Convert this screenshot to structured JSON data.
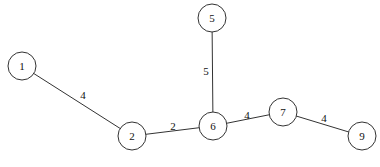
{
  "graph": {
    "type": "weighted-undirected-tree",
    "nodes": [
      {
        "id": "1",
        "label": "1",
        "x": 22,
        "y": 66
      },
      {
        "id": "2",
        "label": "2",
        "x": 132,
        "y": 136
      },
      {
        "id": "5",
        "label": "5",
        "x": 212,
        "y": 18
      },
      {
        "id": "6",
        "label": "6",
        "x": 213,
        "y": 126
      },
      {
        "id": "7",
        "label": "7",
        "x": 283,
        "y": 112
      },
      {
        "id": "9",
        "label": "9",
        "x": 362,
        "y": 136
      }
    ],
    "edges": [
      {
        "from": "1",
        "to": "2",
        "weight": "4",
        "lx": 83,
        "ly": 99
      },
      {
        "from": "2",
        "to": "6",
        "weight": "2",
        "lx": 173,
        "ly": 130
      },
      {
        "from": "5",
        "to": "6",
        "weight": "5",
        "lx": 206,
        "ly": 75
      },
      {
        "from": "6",
        "to": "7",
        "weight": "4",
        "lx": 247,
        "ly": 119
      },
      {
        "from": "7",
        "to": "9",
        "weight": "4",
        "lx": 324,
        "ly": 122
      }
    ],
    "node_radius": 14,
    "colors": {
      "stroke": "#333333",
      "fill": "#ffffff",
      "text": "#111111"
    }
  }
}
